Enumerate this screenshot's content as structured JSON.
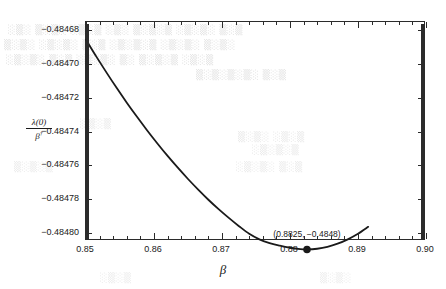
{
  "chart_data": {
    "type": "line",
    "title": "",
    "xlabel": "β",
    "ylabel_numerator": "λ(0)",
    "ylabel_denominator": "β",
    "ylabel_denominator_sup": "†",
    "xlim": [
      0.85,
      0.9
    ],
    "ylim": [
      -0.484805,
      -0.484675
    ],
    "grid": false,
    "legend": null,
    "xticks": [
      0.85,
      0.86,
      0.87,
      0.88,
      0.89,
      0.9
    ],
    "xtick_labels": [
      "0.85",
      "0.86",
      "0.87",
      "0.88",
      "0.89",
      "0.90"
    ],
    "xtick_minor_step": 0.002,
    "yticks": [
      -0.48468,
      -0.4847,
      -0.48472,
      -0.48474,
      -0.48476,
      -0.48478,
      -0.4848
    ],
    "ytick_labels": [
      "-0.48468",
      "-0.48470",
      "-0.48472",
      "-0.48474",
      "-0.48476",
      "-0.48478",
      "-0.48480"
    ],
    "ytick_minor_step": 5e-07,
    "curve_color": "#1a1a1a",
    "curve_width": 1.8,
    "series": [
      {
        "name": "lambda0-over-beta",
        "x": [
          0.85,
          0.8515,
          0.853,
          0.8545,
          0.856,
          0.8575,
          0.859,
          0.8605,
          0.862,
          0.8635,
          0.865,
          0.8665,
          0.868,
          0.8695,
          0.871,
          0.8725,
          0.874,
          0.8755,
          0.877,
          0.8785,
          0.88,
          0.8815,
          0.8825,
          0.884,
          0.8855,
          0.887,
          0.8885,
          0.89,
          0.8915
        ],
        "y": [
          -0.4846855,
          -0.4846954,
          -0.4847049,
          -0.4847141,
          -0.4847229,
          -0.4847313,
          -0.4847394,
          -0.4847471,
          -0.4847545,
          -0.4847615,
          -0.4847682,
          -0.4847745,
          -0.4847805,
          -0.4847861,
          -0.4847913,
          -0.4847962,
          -0.4848007,
          -0.484804,
          -0.4848063,
          -0.4848078,
          -0.484809,
          -0.4848098,
          -0.48481,
          -0.4848096,
          -0.4848085,
          -0.4848066,
          -0.484804,
          -0.4848007,
          -0.4847966
        ]
      }
    ],
    "annotations": [
      {
        "name": "minimum-point",
        "text": "(0.8825, −0.4848)",
        "x": 0.8825,
        "y": -0.48481,
        "marker": "filled-circle",
        "marker_size": 5.5,
        "label_offset_y": -14
      }
    ]
  },
  "background_text": {
    "note": "faint bleed-through from reverse of scanned page",
    "lines": [
      "░▒░ ▒░▒░ ░▒░▒ ░▒░ ▒░▒░▒ ░▒░▒░ ▒░▒",
      "▒░▒░ ░▒░▒░ ▒░▒ ░▒░▒░▒ ░▒░▒░ ▒░▒░",
      "░▒░▒░ ▒░▒ ░▒░▒░ ▒░ ▒░▒░▒ ░▒░▒",
      "▒░▒░▒░▒░ ▒░▒",
      "░▒░▒",
      "▒░▒░ ░▒░▒",
      "░▒░▒░▒",
      "▒░▒░▒",
      "░▒░▒░ ▒░▒",
      "░▒░▒",
      "▒░▒░"
    ]
  }
}
